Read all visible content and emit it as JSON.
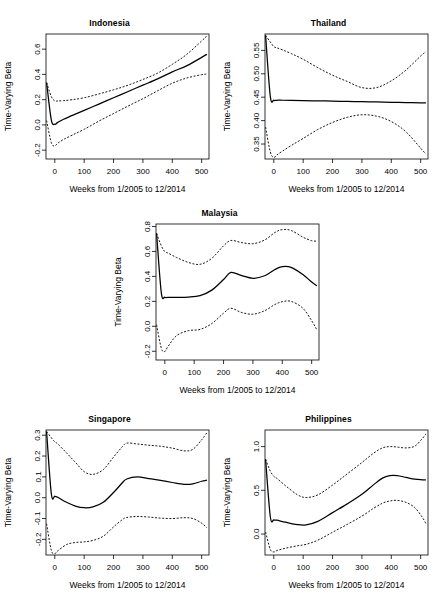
{
  "figure": {
    "shared_xlabel": "Weeks from 1/2005 to 12/2014",
    "shared_ylabel": "Time-Varying Beta",
    "bottom_caption": ""
  },
  "chart_data": [
    {
      "type": "line",
      "title": "Indonesia",
      "xlabel": "Weeks from 1/2005 to 12/2014",
      "ylabel": "Time-Varying Beta",
      "xlim": [
        -30,
        525
      ],
      "ylim": [
        -0.27,
        0.72
      ],
      "xticks": [
        0,
        100,
        200,
        300,
        400,
        500
      ],
      "yticks": [
        -0.2,
        0.0,
        0.2,
        0.4,
        0.6
      ],
      "ytick_labels": [
        "-0.2",
        "0.0",
        "0.2",
        "0.4",
        "0.6"
      ],
      "grid": false,
      "legend": "none",
      "x": [
        -28,
        -12,
        0,
        10,
        30,
        60,
        100,
        150,
        200,
        250,
        300,
        350,
        400,
        450,
        500,
        518
      ],
      "series": [
        {
          "name": "estimate",
          "style": "solid",
          "values": [
            0.335,
            0.04,
            0.005,
            0.02,
            0.045,
            0.075,
            0.115,
            0.165,
            0.215,
            0.265,
            0.315,
            0.365,
            0.42,
            0.47,
            0.535,
            0.56
          ]
        },
        {
          "name": "upper-confidence-band",
          "style": "dashed",
          "values": [
            0.335,
            0.225,
            0.19,
            0.19,
            0.192,
            0.2,
            0.215,
            0.245,
            0.278,
            0.315,
            0.36,
            0.41,
            0.48,
            0.56,
            0.665,
            0.705
          ]
        },
        {
          "name": "lower-confidence-band",
          "style": "dashed",
          "values": [
            0.035,
            -0.14,
            -0.165,
            -0.145,
            -0.115,
            -0.08,
            -0.035,
            0.03,
            0.09,
            0.15,
            0.208,
            0.27,
            0.33,
            0.372,
            0.398,
            0.402
          ]
        }
      ]
    },
    {
      "type": "line",
      "title": "Thailand",
      "xlabel": "Weeks from 1/2005 to 12/2014",
      "ylabel": "Time-Varying Beta",
      "xlim": [
        -30,
        525
      ],
      "ylim": [
        0.318,
        0.585
      ],
      "xticks": [
        0,
        100,
        200,
        300,
        400,
        500
      ],
      "yticks": [
        0.35,
        0.4,
        0.45,
        0.5,
        0.55
      ],
      "ytick_labels": [
        "0.35",
        "0.40",
        "0.45",
        "0.50",
        "0.55"
      ],
      "grid": false,
      "legend": "none",
      "x": [
        -28,
        -12,
        0,
        10,
        30,
        60,
        100,
        150,
        200,
        250,
        300,
        350,
        400,
        450,
        500,
        518
      ],
      "series": [
        {
          "name": "estimate",
          "style": "solid",
          "values": [
            0.582,
            0.452,
            0.4435,
            0.4435,
            0.4435,
            0.4432,
            0.4428,
            0.4422,
            0.4416,
            0.441,
            0.4404,
            0.4398,
            0.4392,
            0.4386,
            0.438,
            0.4378
          ]
        },
        {
          "name": "upper-confidence-band",
          "style": "dashed",
          "values": [
            0.582,
            0.568,
            0.558,
            0.5555,
            0.551,
            0.543,
            0.531,
            0.513,
            0.497,
            0.4835,
            0.4705,
            0.4705,
            0.485,
            0.508,
            0.538,
            0.547
          ]
        },
        {
          "name": "lower-confidence-band",
          "style": "dashed",
          "values": [
            0.386,
            0.333,
            0.3215,
            0.3265,
            0.335,
            0.347,
            0.362,
            0.381,
            0.396,
            0.407,
            0.4125,
            0.4095,
            0.398,
            0.376,
            0.341,
            0.3285
          ]
        }
      ]
    },
    {
      "type": "line",
      "title": "Malaysia",
      "xlabel": "Weeks from 1/2005 to 12/2014",
      "ylabel": "Time-Varying Beta",
      "xlim": [
        -30,
        525
      ],
      "ylim": [
        -0.27,
        0.82
      ],
      "xticks": [
        0,
        100,
        200,
        300,
        400,
        500
      ],
      "yticks": [
        -0.2,
        0.0,
        0.2,
        0.4,
        0.6,
        0.8
      ],
      "ytick_labels": [
        "-0.2",
        "0.0",
        "0.2",
        "0.4",
        "0.6",
        "0.8"
      ],
      "grid": false,
      "legend": "none",
      "x": [
        -28,
        -12,
        0,
        10,
        40,
        80,
        120,
        160,
        200,
        225,
        260,
        300,
        340,
        375,
        400,
        430,
        470,
        500,
        518
      ],
      "series": [
        {
          "name": "estimate",
          "style": "solid",
          "values": [
            0.745,
            0.27,
            0.233,
            0.232,
            0.232,
            0.234,
            0.246,
            0.29,
            0.375,
            0.432,
            0.408,
            0.385,
            0.405,
            0.455,
            0.478,
            0.472,
            0.415,
            0.355,
            0.325
          ]
        },
        {
          "name": "upper-confidence-band",
          "style": "dashed",
          "values": [
            0.745,
            0.645,
            0.598,
            0.588,
            0.552,
            0.512,
            0.497,
            0.545,
            0.645,
            0.688,
            0.672,
            0.662,
            0.692,
            0.752,
            0.775,
            0.768,
            0.715,
            0.686,
            0.683
          ]
        },
        {
          "name": "lower-confidence-band",
          "style": "dashed",
          "values": [
            0.012,
            -0.175,
            -0.202,
            -0.165,
            -0.075,
            -0.035,
            -0.025,
            0.022,
            0.105,
            0.145,
            0.112,
            0.097,
            0.125,
            0.175,
            0.197,
            0.2,
            0.145,
            0.045,
            -0.03
          ]
        }
      ]
    },
    {
      "type": "line",
      "title": "Singapore",
      "xlabel": "Weeks from 1/2005 to 12/2014",
      "ylabel": "Time-Varying Beta",
      "xlim": [
        -30,
        525
      ],
      "ylim": [
        -0.275,
        0.325
      ],
      "xticks": [
        0,
        100,
        200,
        300,
        400,
        500
      ],
      "yticks": [
        -0.2,
        -0.1,
        0.0,
        0.1,
        0.2,
        0.3
      ],
      "ytick_labels": [
        "-0.2",
        "-0.1",
        "0.0",
        "0.1",
        "0.2",
        "0.3"
      ],
      "grid": false,
      "legend": "none",
      "x": [
        -28,
        -12,
        0,
        10,
        40,
        70,
        100,
        130,
        165,
        200,
        230,
        245,
        280,
        320,
        360,
        400,
        440,
        470,
        500,
        518
      ],
      "series": [
        {
          "name": "estimate",
          "style": "solid",
          "values": [
            0.318,
            0.02,
            0.007,
            0.002,
            -0.022,
            -0.04,
            -0.048,
            -0.044,
            -0.022,
            0.025,
            0.072,
            0.09,
            0.1,
            0.092,
            0.083,
            0.073,
            0.064,
            0.066,
            0.079,
            0.084
          ]
        },
        {
          "name": "upper-confidence-band",
          "style": "dashed",
          "values": [
            0.318,
            0.288,
            0.268,
            0.258,
            0.215,
            0.17,
            0.125,
            0.112,
            0.135,
            0.195,
            0.245,
            0.262,
            0.258,
            0.252,
            0.247,
            0.238,
            0.225,
            0.232,
            0.278,
            0.312
          ]
        },
        {
          "name": "lower-confidence-band",
          "style": "dashed",
          "values": [
            -0.125,
            -0.252,
            -0.268,
            -0.255,
            -0.225,
            -0.215,
            -0.212,
            -0.205,
            -0.185,
            -0.14,
            -0.105,
            -0.095,
            -0.09,
            -0.093,
            -0.098,
            -0.1,
            -0.096,
            -0.1,
            -0.122,
            -0.145
          ]
        }
      ]
    },
    {
      "type": "line",
      "title": "Philippines",
      "xlabel": "Weeks from 1/2005 to 12/2014",
      "ylabel": "Time-Varying Beta",
      "xlim": [
        -30,
        525
      ],
      "ylim": [
        -0.24,
        1.19
      ],
      "xticks": [
        0,
        100,
        200,
        300,
        400,
        500
      ],
      "yticks": [
        0.0,
        0.5,
        1.0
      ],
      "ytick_labels": [
        "0.0",
        "0.5",
        "1.0"
      ],
      "grid": false,
      "legend": "none",
      "x": [
        -28,
        -12,
        0,
        10,
        40,
        80,
        110,
        150,
        200,
        250,
        300,
        340,
        370,
        395,
        420,
        450,
        480,
        505,
        518
      ],
      "series": [
        {
          "name": "estimate",
          "style": "solid",
          "values": [
            0.855,
            0.2,
            0.162,
            0.158,
            0.135,
            0.108,
            0.105,
            0.145,
            0.245,
            0.345,
            0.455,
            0.565,
            0.64,
            0.668,
            0.668,
            0.648,
            0.628,
            0.62,
            0.618
          ]
        },
        {
          "name": "upper-confidence-band",
          "style": "dashed",
          "values": [
            0.855,
            0.72,
            0.66,
            0.638,
            0.552,
            0.45,
            0.418,
            0.448,
            0.56,
            0.688,
            0.818,
            0.925,
            0.985,
            1.0,
            0.995,
            0.985,
            1.005,
            1.09,
            1.145
          ]
        },
        {
          "name": "lower-confidence-band",
          "style": "dashed",
          "values": [
            0.022,
            -0.175,
            -0.205,
            -0.19,
            -0.162,
            -0.135,
            -0.118,
            -0.07,
            0.02,
            0.11,
            0.205,
            0.295,
            0.352,
            0.378,
            0.385,
            0.362,
            0.302,
            0.195,
            0.118
          ]
        }
      ]
    }
  ]
}
